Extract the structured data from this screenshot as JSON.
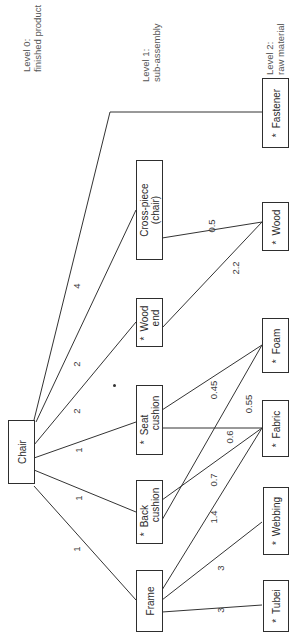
{
  "diagram": {
    "type": "product-structure-tree",
    "orientation": "rotated-90-ccw",
    "levels": [
      {
        "id": "level0",
        "line1": "Level 0:",
        "line2": "finished product"
      },
      {
        "id": "level1",
        "line1": "Level 1:",
        "line2": "sub-assembly"
      },
      {
        "id": "level2",
        "line1": "Level 2:",
        "line2": "raw material"
      }
    ],
    "nodes": {
      "chair": {
        "line1": "Chair",
        "line2": "",
        "star": ""
      },
      "frame": {
        "line1": "Frame",
        "line2": "",
        "star": ""
      },
      "back_cushion": {
        "line1": "Back",
        "line2": "cushion",
        "star": "*"
      },
      "seat_cushion": {
        "line1": "Seat",
        "line2": "cushion",
        "star": "*"
      },
      "wood_end": {
        "line1": "Wood",
        "line2": "end",
        "star": "*"
      },
      "cross_piece": {
        "line1": "Cross-piece",
        "line2": "(chair)",
        "star": ""
      },
      "fastener": {
        "line1": "Fastener",
        "line2": "",
        "star": "*"
      },
      "wood": {
        "line1": "Wood",
        "line2": "",
        "star": "*"
      },
      "foam": {
        "line1": "Foam",
        "line2": "",
        "star": "*"
      },
      "fabric": {
        "line1": "Fabric",
        "line2": "",
        "star": "*"
      },
      "webbing": {
        "line1": "Webbing",
        "line2": "",
        "star": "*"
      },
      "tubei": {
        "line1": "Tubei",
        "line2": "",
        "star": "*"
      }
    },
    "edges": [
      {
        "from": "chair",
        "to": "frame",
        "qty": "1"
      },
      {
        "from": "chair",
        "to": "back_cushion",
        "qty": "1"
      },
      {
        "from": "chair",
        "to": "seat_cushion",
        "qty": "1"
      },
      {
        "from": "chair",
        "to": "wood_end",
        "qty": "2"
      },
      {
        "from": "chair",
        "to": "cross_piece",
        "qty": "2"
      },
      {
        "from": "chair",
        "to": "fastener",
        "qty": "4"
      },
      {
        "from": "cross_piece",
        "to": "wood",
        "qty": "0.5"
      },
      {
        "from": "wood_end",
        "to": "wood",
        "qty": "2.2"
      },
      {
        "from": "seat_cushion",
        "to": "foam",
        "qty": "0.45"
      },
      {
        "from": "back_cushion",
        "to": "foam",
        "qty": "0.55"
      },
      {
        "from": "seat_cushion",
        "to": "fabric",
        "qty": "0.6"
      },
      {
        "from": "back_cushion",
        "to": "fabric",
        "qty": "0.7"
      },
      {
        "from": "frame",
        "to": "fabric",
        "qty": "1.4"
      },
      {
        "from": "frame",
        "to": "webbing",
        "qty": "3"
      },
      {
        "from": "frame",
        "to": "tubei",
        "qty": "3"
      }
    ]
  }
}
